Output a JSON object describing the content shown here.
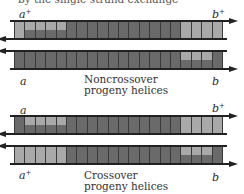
{
  "top_cut_text": "by the single-strand exchange",
  "colors": {
    "dark": "#6a6a6a",
    "light": "#a9a9a9",
    "stroke": "#222222"
  },
  "noncrossover": {
    "caption_line1": "Noncrossover",
    "caption_line2": "progeny helices",
    "helix1": {
      "left_label": "a",
      "left_sup": "+",
      "right_label": "b",
      "right_sup": "+",
      "top_arrow": "right",
      "bottom_arrow": "left",
      "segments_top": [
        "L",
        "L",
        "L",
        "L",
        "L",
        "D",
        "D",
        "D",
        "D",
        "D",
        "D",
        "D",
        "D",
        "D",
        "D",
        "D",
        "L",
        "L",
        "L",
        "L"
      ],
      "segments_bottom": [
        "L",
        "D",
        "D",
        "D",
        "D",
        "D",
        "D",
        "D",
        "D",
        "D",
        "D",
        "D",
        "D",
        "D",
        "D",
        "D",
        "L",
        "L",
        "L",
        "L"
      ]
    },
    "helix2": {
      "left_label": "a",
      "left_sup": "",
      "right_label": "b",
      "right_sup": "",
      "top_arrow": "left",
      "bottom_arrow": "right",
      "segments_top": [
        "D",
        "D",
        "D",
        "D",
        "D",
        "D",
        "D",
        "D",
        "D",
        "D",
        "D",
        "D",
        "D",
        "D",
        "D",
        "D",
        "L",
        "L",
        "L",
        "D"
      ],
      "segments_bottom": [
        "D",
        "D",
        "D",
        "D",
        "D",
        "D",
        "D",
        "D",
        "D",
        "D",
        "D",
        "D",
        "D",
        "D",
        "D",
        "D",
        "D",
        "D",
        "D",
        "D"
      ]
    }
  },
  "crossover": {
    "caption_line1": "Crossover",
    "caption_line2": "progeny helices",
    "helix3": {
      "left_label": "a",
      "left_sup": "",
      "right_label": "b",
      "right_sup": "+",
      "top_arrow": "right",
      "bottom_arrow": "left",
      "segments_top": [
        "D",
        "L",
        "L",
        "L",
        "L",
        "D",
        "D",
        "D",
        "D",
        "D",
        "D",
        "D",
        "D",
        "D",
        "D",
        "D",
        "L",
        "L",
        "L",
        "L"
      ],
      "segments_bottom": [
        "D",
        "D",
        "D",
        "D",
        "D",
        "D",
        "D",
        "D",
        "D",
        "D",
        "D",
        "D",
        "D",
        "D",
        "D",
        "D",
        "L",
        "L",
        "L",
        "L"
      ]
    },
    "helix4": {
      "left_label": "a",
      "left_sup": "+",
      "right_label": "b",
      "right_sup": "",
      "top_arrow": "left",
      "bottom_arrow": "right",
      "segments_top": [
        "L",
        "L",
        "L",
        "L",
        "L",
        "D",
        "D",
        "D",
        "D",
        "D",
        "D",
        "D",
        "D",
        "D",
        "D",
        "D",
        "L",
        "L",
        "L",
        "D"
      ],
      "segments_bottom": [
        "L",
        "L",
        "L",
        "L",
        "L",
        "D",
        "D",
        "D",
        "D",
        "D",
        "D",
        "D",
        "D",
        "D",
        "D",
        "D",
        "D",
        "D",
        "D",
        "D"
      ]
    }
  }
}
